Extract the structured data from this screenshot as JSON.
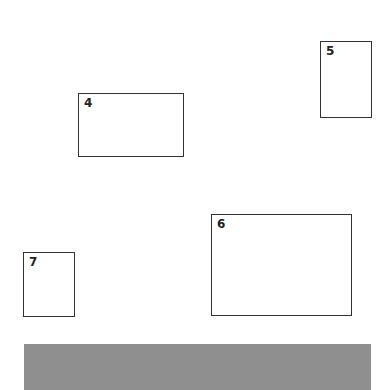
{
  "boxes": [
    {
      "label": "4",
      "x": 78,
      "y": 93,
      "w": 106,
      "h": 64
    },
    {
      "label": "5",
      "x": 320,
      "y": 41,
      "w": 52,
      "h": 77
    },
    {
      "label": "6",
      "x": 211,
      "y": 214,
      "w": 141,
      "h": 102
    },
    {
      "label": "7",
      "x": 23,
      "y": 252,
      "w": 52,
      "h": 65
    }
  ],
  "bar": {
    "x": 24,
    "y": 344,
    "w": 347,
    "h": 46,
    "color": "#8f8f8f"
  }
}
